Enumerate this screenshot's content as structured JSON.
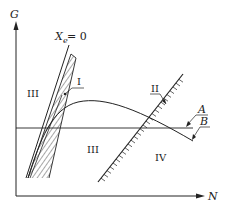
{
  "diagram": {
    "axes": {
      "y_label": "G",
      "x_label": "N"
    },
    "line_xe": {
      "label_main": "X",
      "label_sub": "e",
      "label_eq": " = 0"
    },
    "regions": [
      {
        "id": "III-left",
        "label": "III"
      },
      {
        "id": "III-center",
        "label": "III"
      },
      {
        "id": "IV",
        "label": "IV"
      }
    ],
    "boundaries": [
      {
        "id": "I",
        "label": "I"
      },
      {
        "id": "II",
        "label": "II"
      }
    ],
    "curves": [
      {
        "id": "A",
        "label": "A"
      },
      {
        "id": "B",
        "label": "B"
      }
    ],
    "colors": {
      "ink": "#222222",
      "background": "#ffffff"
    }
  }
}
